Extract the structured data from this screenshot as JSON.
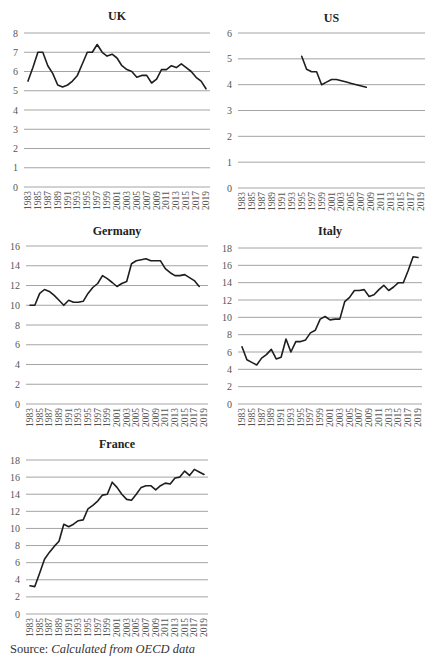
{
  "source": {
    "label": "Source:",
    "text": "Calculated from OECD data"
  },
  "chart_data": [
    {
      "type": "line",
      "title": "UK",
      "xlabel": "",
      "ylabel": "",
      "ylim": [
        0,
        8
      ],
      "yticks": [
        0,
        1,
        2,
        3,
        4,
        5,
        6,
        7,
        8
      ],
      "grid": true,
      "legend": "none",
      "x": [
        1983,
        1984,
        1985,
        1986,
        1987,
        1988,
        1989,
        1990,
        1991,
        1992,
        1993,
        1994,
        1995,
        1996,
        1997,
        1998,
        1999,
        2000,
        2001,
        2002,
        2003,
        2004,
        2005,
        2006,
        2007,
        2008,
        2009,
        2010,
        2011,
        2012,
        2013,
        2014,
        2015,
        2016,
        2017,
        2018,
        2019
      ],
      "series": [
        {
          "name": "UK",
          "values": [
            5.5,
            6.2,
            7.0,
            7.0,
            6.3,
            5.9,
            5.3,
            5.2,
            5.3,
            5.5,
            5.8,
            6.4,
            7.0,
            7.0,
            7.4,
            7.0,
            6.8,
            6.9,
            6.7,
            6.3,
            6.1,
            6.0,
            5.7,
            5.8,
            5.8,
            5.4,
            5.6,
            6.1,
            6.1,
            6.3,
            6.2,
            6.4,
            6.2,
            6.0,
            5.7,
            5.5,
            5.1
          ]
        }
      ]
    },
    {
      "type": "line",
      "title": "US",
      "xlabel": "",
      "ylabel": "",
      "ylim": [
        0,
        6
      ],
      "yticks": [
        0,
        1,
        2,
        3,
        4,
        5,
        6
      ],
      "grid": true,
      "legend": "none",
      "x": [
        1983,
        1984,
        1985,
        1986,
        1987,
        1988,
        1989,
        1990,
        1991,
        1992,
        1993,
        1994,
        1995,
        1996,
        1997,
        1998,
        1999,
        2000,
        2001,
        2002,
        2003,
        2004,
        2005,
        2006,
        2007,
        2008,
        2009,
        2010,
        2011,
        2012,
        2013,
        2014,
        2015,
        2016,
        2017,
        2018,
        2019
      ],
      "series": [
        {
          "name": "US",
          "values": [
            null,
            null,
            null,
            null,
            null,
            null,
            null,
            null,
            null,
            null,
            null,
            null,
            5.1,
            4.6,
            4.5,
            4.5,
            4.0,
            4.1,
            4.2,
            4.2,
            4.15,
            4.1,
            4.05,
            4.0,
            3.95,
            3.9,
            null,
            null,
            null,
            null,
            null,
            null,
            null,
            null,
            null,
            null,
            null
          ]
        }
      ]
    },
    {
      "type": "line",
      "title": "Germany",
      "xlabel": "",
      "ylabel": "",
      "ylim": [
        0,
        16
      ],
      "yticks": [
        0,
        2,
        4,
        6,
        8,
        10,
        12,
        14,
        16
      ],
      "grid": true,
      "legend": "none",
      "x": [
        1983,
        1984,
        1985,
        1986,
        1987,
        1988,
        1989,
        1990,
        1991,
        1992,
        1993,
        1994,
        1995,
        1996,
        1997,
        1998,
        1999,
        2000,
        2001,
        2002,
        2003,
        2004,
        2005,
        2006,
        2007,
        2008,
        2009,
        2010,
        2011,
        2012,
        2013,
        2014,
        2015,
        2016,
        2017,
        2018,
        2019
      ],
      "series": [
        {
          "name": "Germany",
          "values": [
            10.0,
            10.0,
            11.2,
            11.6,
            11.4,
            11.0,
            10.5,
            10.0,
            10.5,
            10.3,
            10.3,
            10.4,
            11.2,
            11.8,
            12.2,
            13.0,
            12.7,
            12.3,
            11.9,
            12.2,
            12.4,
            14.2,
            14.5,
            14.6,
            14.7,
            14.5,
            14.5,
            14.5,
            13.7,
            13.3,
            13.0,
            13.0,
            13.1,
            12.8,
            12.5,
            11.9,
            null
          ]
        }
      ]
    },
    {
      "type": "line",
      "title": "Italy",
      "xlabel": "",
      "ylabel": "",
      "ylim": [
        0,
        18
      ],
      "yticks": [
        0,
        2,
        4,
        6,
        8,
        10,
        12,
        14,
        16,
        18
      ],
      "grid": true,
      "legend": "none",
      "x": [
        1983,
        1984,
        1985,
        1986,
        1987,
        1988,
        1989,
        1990,
        1991,
        1992,
        1993,
        1994,
        1995,
        1996,
        1997,
        1998,
        1999,
        2000,
        2001,
        2002,
        2003,
        2004,
        2005,
        2006,
        2007,
        2008,
        2009,
        2010,
        2011,
        2012,
        2013,
        2014,
        2015,
        2016,
        2017,
        2018,
        2019
      ],
      "series": [
        {
          "name": "Italy",
          "values": [
            6.6,
            5.1,
            4.8,
            4.5,
            5.3,
            5.7,
            6.3,
            5.2,
            5.4,
            7.5,
            6.0,
            7.2,
            7.2,
            7.4,
            8.2,
            8.5,
            9.8,
            10.1,
            9.7,
            9.8,
            9.8,
            11.8,
            12.3,
            13.1,
            13.1,
            13.2,
            12.4,
            12.6,
            13.2,
            13.7,
            13.1,
            13.5,
            14.0,
            14.0,
            15.4,
            17.0,
            16.9
          ]
        }
      ]
    },
    {
      "type": "line",
      "title": "France",
      "xlabel": "",
      "ylabel": "",
      "ylim": [
        0,
        18
      ],
      "yticks": [
        0,
        2,
        4,
        6,
        8,
        10,
        12,
        14,
        16,
        18
      ],
      "grid": true,
      "legend": "none",
      "x": [
        1983,
        1984,
        1985,
        1986,
        1987,
        1988,
        1989,
        1990,
        1991,
        1992,
        1993,
        1994,
        1995,
        1996,
        1997,
        1998,
        1999,
        2000,
        2001,
        2002,
        2003,
        2004,
        2005,
        2006,
        2007,
        2008,
        2009,
        2010,
        2011,
        2012,
        2013,
        2014,
        2015,
        2016,
        2017,
        2018,
        2019
      ],
      "series": [
        {
          "name": "France",
          "values": [
            3.3,
            3.2,
            4.8,
            6.4,
            7.2,
            7.9,
            8.5,
            10.5,
            10.2,
            10.5,
            10.9,
            11.0,
            12.3,
            12.7,
            13.2,
            13.9,
            14.0,
            15.4,
            14.8,
            14.0,
            13.4,
            13.3,
            14.0,
            14.8,
            15.0,
            15.0,
            14.5,
            15.0,
            15.3,
            15.2,
            15.9,
            16.0,
            16.7,
            16.2,
            16.9,
            16.6,
            16.3
          ]
        }
      ]
    }
  ],
  "x_tick_labels": [
    "1983",
    "1985",
    "1987",
    "1989",
    "1991",
    "1993",
    "1995",
    "1997",
    "1999",
    "2001",
    "2003",
    "2005",
    "2007",
    "2009",
    "2011",
    "2013",
    "2015",
    "2017",
    "2019"
  ]
}
